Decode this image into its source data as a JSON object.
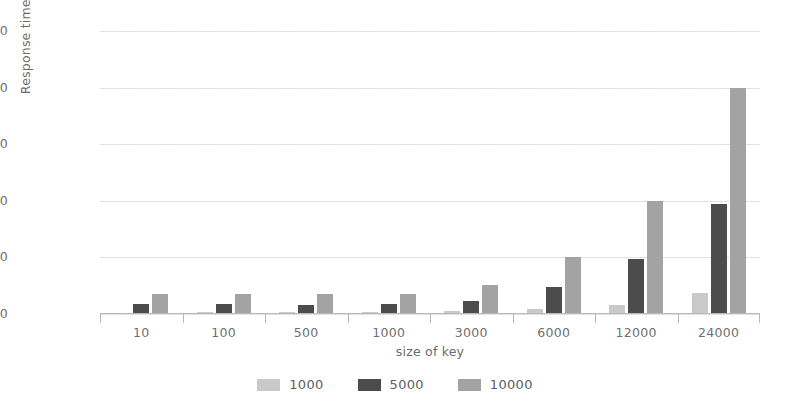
{
  "chart_data": {
    "type": "bar",
    "title": "",
    "xlabel": "size of key",
    "ylabel": "Response time (ms)",
    "categories": [
      "10",
      "100",
      "500",
      "1000",
      "3000",
      "6000",
      "12000",
      "24000"
    ],
    "series": [
      {
        "name": "1000",
        "color": "#c9c9c9",
        "values": [
          6,
          7,
          8,
          9,
          12,
          22,
          42,
          95
        ]
      },
      {
        "name": "5000",
        "color": "#4c4c4c",
        "values": [
          45,
          44,
          42,
          43,
          58,
          120,
          245,
          488
        ]
      },
      {
        "name": "10000",
        "color": "#a3a3a3",
        "values": [
          90,
          88,
          90,
          90,
          130,
          250,
          500,
          1000
        ]
      }
    ],
    "ylim": [
      0,
      1250
    ],
    "yticks": [
      0,
      250,
      500,
      750,
      1000,
      1250
    ],
    "ytick_labels": [
      "0",
      "250",
      "500",
      "750",
      "1000",
      "1250"
    ],
    "grid": true,
    "legend_position": "bottom",
    "legend_entries": [
      "1000",
      "5000",
      "10000"
    ]
  }
}
